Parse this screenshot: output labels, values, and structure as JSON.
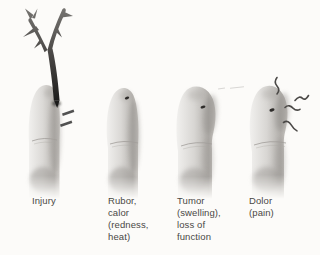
{
  "page": {
    "background_color": "#fcfbf9"
  },
  "figure": {
    "panels": [
      {
        "id": "injury",
        "label": "Injury",
        "illustration": "finger-pierced-by-thorny-branch"
      },
      {
        "id": "rubor",
        "label": "Rubor,\ncalor\n(redness,\nheat)",
        "illustration": "finger-with-embedded-thorn-wound"
      },
      {
        "id": "tumor",
        "label": "Tumor\n(swelling),\nloss of\nfunction",
        "illustration": "swollen-finger-with-wound"
      },
      {
        "id": "dolor",
        "label": "Dolor\n(pain)",
        "illustration": "swollen-finger-with-pain-lines"
      }
    ],
    "colors": {
      "label_text": "#4a4845",
      "finger_highlight": "#f1f0ee",
      "finger_midtone": "#dbd9d6",
      "finger_shadow": "#b2afab",
      "branch_dark": "#1a1918",
      "pain_line": "#4b4947",
      "wound_dot": "#2e2c2a"
    }
  }
}
